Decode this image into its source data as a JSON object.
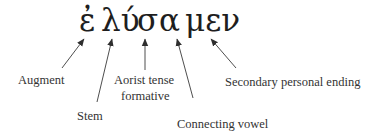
{
  "word_parts": [
    {
      "text": "ἐ",
      "x": 79
    },
    {
      "text": "λύ",
      "x": 101
    },
    {
      "text": "σ",
      "x": 137
    },
    {
      "text": "α",
      "x": 159
    },
    {
      "text": "μεν",
      "x": 185
    }
  ],
  "labels": {
    "augment": "Augment",
    "stem": "Stem",
    "aorist_line1": "Aorist tense",
    "aorist_line2": "formative",
    "connecting_vowel": "Connecting vowel",
    "secondary_ending": "Secondary personal ending"
  },
  "colors": {
    "text": "#2a2a2a",
    "arrow": "#3a3a3a"
  }
}
